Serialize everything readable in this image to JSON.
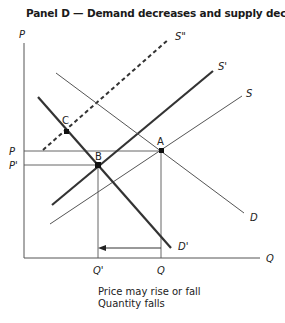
{
  "title": "Panel D — Demand decreases and supply decreases",
  "axes": {
    "y_label": "P",
    "x_label": "Q"
  },
  "price_labels": {
    "p": "P",
    "p_prime": "P'"
  },
  "quantity_labels": {
    "q": "Q",
    "q_prime": "Q'"
  },
  "curves": {
    "s": "S",
    "s_prime": "S'",
    "s_double_prime": "S\"",
    "d": "D",
    "d_prime": "D'"
  },
  "points": {
    "a": "A",
    "b": "B",
    "c": "C"
  },
  "caption": {
    "line1": "Price may rise or fall",
    "line2": "Quantity falls"
  },
  "colors": {
    "curve": "#333333",
    "thin": "#555555",
    "text": "#222222"
  }
}
